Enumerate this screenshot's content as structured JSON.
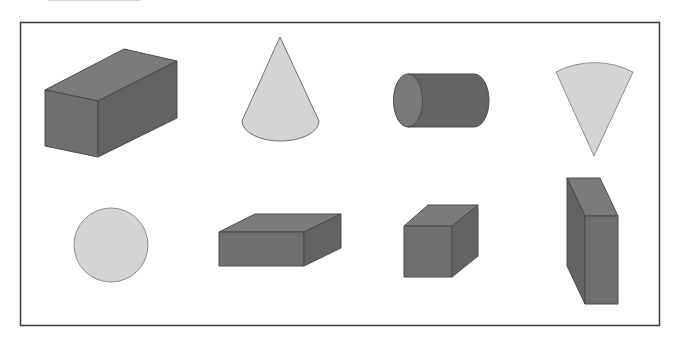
{
  "figure": {
    "title": "",
    "frame": {
      "x": 20,
      "y": 22,
      "width": 639,
      "height": 303,
      "stroke": "#3a3a3a"
    },
    "colors": {
      "dark_top": "#7b7b7b",
      "dark_front": "#6f6f6f",
      "dark_side": "#636363",
      "dark_stroke": "#4a4a4a",
      "light_fill": "#d4d4d4",
      "light_stroke": "#8c8c8c",
      "cyl_body": "#646464",
      "cyl_cap": "#7a7a7a"
    },
    "rows": [
      {
        "shapes": [
          {
            "id": "rect-prism-long",
            "label": "rectangular prism",
            "kind": "cuboid"
          },
          {
            "id": "cone",
            "label": "cone",
            "kind": "cone"
          },
          {
            "id": "cylinder",
            "label": "cylinder",
            "kind": "cylinder"
          },
          {
            "id": "circular-sector",
            "label": "circular sector",
            "kind": "sector"
          }
        ]
      },
      {
        "shapes": [
          {
            "id": "circle",
            "label": "circle",
            "kind": "circle"
          },
          {
            "id": "rect-prism-flat",
            "label": "flat rectangular prism",
            "kind": "cuboid"
          },
          {
            "id": "cube",
            "label": "cube",
            "kind": "cuboid"
          },
          {
            "id": "rect-prism-tall",
            "label": "tall rectangular prism",
            "kind": "cuboid"
          }
        ]
      }
    ]
  }
}
